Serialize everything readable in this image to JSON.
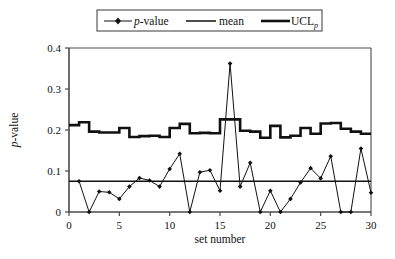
{
  "chart_data": {
    "type": "line",
    "title": "",
    "xlabel": "set number",
    "ylabel": "p-value",
    "xlim": [
      0,
      30
    ],
    "ylim": [
      0,
      0.4
    ],
    "xticks": [
      0,
      5,
      10,
      15,
      20,
      25,
      30
    ],
    "xtick_labels": [
      "0",
      "5",
      "10",
      "15",
      "20",
      "25",
      "30"
    ],
    "yticks": [
      0,
      0.1,
      0.2,
      0.3,
      0.4
    ],
    "ytick_labels": [
      "0",
      "0.1",
      "0.2",
      "0.3",
      "0.4"
    ],
    "grid": false,
    "legend_position": "top-center",
    "x": [
      1,
      2,
      3,
      4,
      5,
      6,
      7,
      8,
      9,
      10,
      11,
      12,
      13,
      14,
      15,
      16,
      17,
      18,
      19,
      20,
      21,
      22,
      23,
      24,
      25,
      26,
      27,
      28,
      29,
      30
    ],
    "series": [
      {
        "name": "p-value",
        "marker": "diamond",
        "values": [
          0.075,
          0.0,
          0.05,
          0.048,
          0.032,
          0.062,
          0.083,
          0.077,
          0.062,
          0.105,
          0.142,
          0.0,
          0.097,
          0.102,
          0.052,
          0.362,
          0.062,
          0.12,
          0.0,
          0.052,
          0.0,
          0.032,
          0.072,
          0.107,
          0.082,
          0.136,
          0.0,
          0.0,
          0.155,
          0.047
        ]
      },
      {
        "name": "mean",
        "marker": "none",
        "values": [
          0.075,
          0.075,
          0.075,
          0.075,
          0.075,
          0.075,
          0.075,
          0.075,
          0.075,
          0.075,
          0.075,
          0.075,
          0.075,
          0.075,
          0.075,
          0.075,
          0.075,
          0.075,
          0.075,
          0.075,
          0.075,
          0.075,
          0.075,
          0.075,
          0.075,
          0.075,
          0.075,
          0.075,
          0.075,
          0.075
        ]
      },
      {
        "name": "UCL_p",
        "marker": "none",
        "step": "pre",
        "values": [
          0.212,
          0.219,
          0.196,
          0.194,
          0.194,
          0.205,
          0.183,
          0.185,
          0.186,
          0.183,
          0.205,
          0.215,
          0.192,
          0.193,
          0.192,
          0.226,
          0.226,
          0.198,
          0.196,
          0.181,
          0.21,
          0.182,
          0.186,
          0.205,
          0.191,
          0.216,
          0.217,
          0.203,
          0.196,
          0.191
        ]
      }
    ]
  },
  "legend": {
    "entries": [
      {
        "label_main": "p",
        "label_rest": "-value",
        "key": "p-value"
      },
      {
        "label_main": "mean",
        "label_rest": "",
        "key": "mean"
      },
      {
        "label_main": "UCL",
        "label_rest": "",
        "label_sub": "p",
        "key": "ucl"
      }
    ]
  }
}
